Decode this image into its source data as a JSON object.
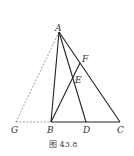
{
  "figure": {
    "caption": "图 43.8",
    "points": {
      "A": {
        "label": "A",
        "x": 59,
        "y": 32
      },
      "B": {
        "label": "B",
        "x": 51,
        "y": 122
      },
      "C": {
        "label": "C",
        "x": 120,
        "y": 122
      },
      "D": {
        "label": "D",
        "x": 86,
        "y": 122
      },
      "E": {
        "label": "E",
        "x": 72,
        "y": 82
      },
      "F": {
        "label": "F",
        "x": 80,
        "y": 63
      },
      "G": {
        "label": "G",
        "x": 16,
        "y": 122
      }
    },
    "solid_segments": [
      "AB",
      "AC",
      "AD",
      "BC",
      "BF"
    ],
    "dashed_segments": [
      "AG",
      "GB"
    ],
    "colors": {
      "line": "#222222",
      "dashed": "#777777",
      "text": "#333333"
    }
  }
}
